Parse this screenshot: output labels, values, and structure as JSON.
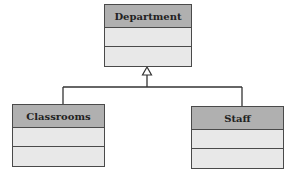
{
  "diagram": {
    "type": "uml-class-inheritance",
    "classes": [
      {
        "name": "Department",
        "role": "parent"
      },
      {
        "name": "Classrooms",
        "role": "child"
      },
      {
        "name": "Staff",
        "role": "child"
      }
    ],
    "relationships": [
      {
        "from": "Classrooms",
        "to": "Department",
        "type": "generalization"
      },
      {
        "from": "Staff",
        "to": "Department",
        "type": "generalization"
      }
    ],
    "colors": {
      "header_fill": "#b0b0b0",
      "section_fill": "#e8e8e8",
      "stroke": "#4a4a4a"
    }
  }
}
